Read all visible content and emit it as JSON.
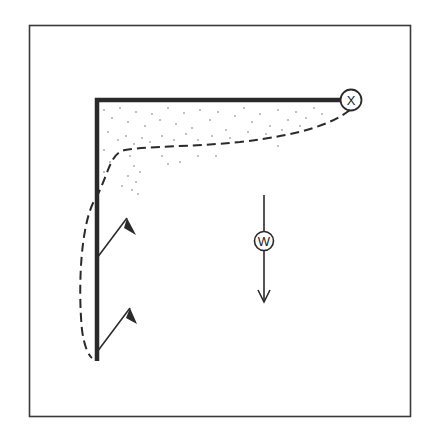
{
  "diagram": {
    "pivot_label": "X",
    "weight_label": "W",
    "colors": {
      "background": "#ffffff",
      "ink": "#2a2a2a",
      "frame": "#3a3a3a"
    }
  }
}
